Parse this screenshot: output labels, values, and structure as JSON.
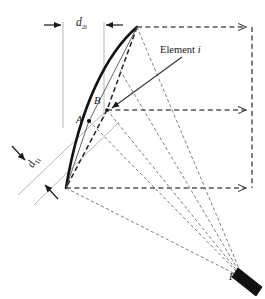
{
  "figure": {
    "type": "technical-diagram",
    "background_color": "#ffffff",
    "width": 265,
    "height": 299
  },
  "labels": {
    "d2i": {
      "base": "d",
      "subscript": "2i",
      "text": "d2i"
    },
    "d1i": {
      "base": "d",
      "subscript": "1i",
      "text": "d1i"
    },
    "point_a": "A",
    "point_b": "B",
    "focal_point": "F",
    "element": "Element i"
  },
  "colors": {
    "arc_bold": "#111111",
    "dashed_ray": "#555555",
    "guide_line": "#9a9a9a",
    "arrow": "#1a1a1a",
    "transducer_fill": "#111111",
    "chord_dashed": "#222222",
    "leader_line": "#333333"
  },
  "geometry": {
    "arc_apex": {
      "x": 137,
      "y": 27
    },
    "arc_base": {
      "x": 66,
      "y": 188
    },
    "point_a": {
      "x": 89,
      "y": 121
    },
    "point_b": {
      "x": 107,
      "y": 110
    },
    "focal_point": {
      "x": 245,
      "y": 281
    },
    "guide_vertical_left_x": 63,
    "guide_vertical_right_x": 104,
    "rays": [
      {
        "name": "top-ray",
        "y": 27
      },
      {
        "name": "middle-ray",
        "y": 110
      },
      {
        "name": "bottom-ray",
        "y": 188
      }
    ],
    "ray_arrow_x": 248,
    "right_vertical_dashed_x": 252
  },
  "caption": {
    "cropped_text": "·  ·   ·    ·     ·      ·       ·"
  }
}
